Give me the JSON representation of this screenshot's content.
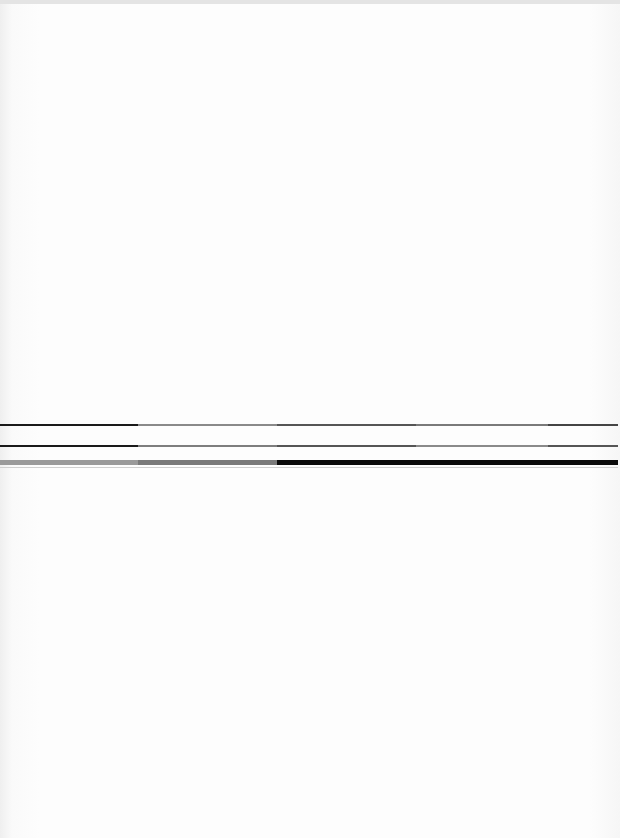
{
  "document": {
    "type": "faded scanned page",
    "visible_text": "",
    "rules": [
      {
        "name": "rule-1",
        "top": 424,
        "height": 2,
        "segments": [
          {
            "width": 138,
            "color": "#1a1a1a"
          },
          {
            "width": 139,
            "color": "#8a8a8a"
          },
          {
            "width": 139,
            "color": "#555555"
          },
          {
            "width": 132,
            "color": "#7a7a7a"
          },
          {
            "width": 70,
            "color": "#444444"
          }
        ]
      },
      {
        "name": "rule-2",
        "top": 445,
        "height": 2,
        "segments": [
          {
            "width": 138,
            "color": "#1a1a1a"
          },
          {
            "width": 139,
            "color": "#7e7e7e"
          },
          {
            "width": 139,
            "color": "#555555"
          },
          {
            "width": 132,
            "color": "#8a8a8a"
          },
          {
            "width": 70,
            "color": "#555555"
          }
        ]
      },
      {
        "name": "rule-3-thick",
        "top": 460,
        "height": 5,
        "segments": [
          {
            "width": 138,
            "color": "#9a9a9a"
          },
          {
            "width": 139,
            "color": "#7a7a7a"
          },
          {
            "width": 341,
            "color": "#0a0a0a"
          }
        ]
      },
      {
        "name": "rule-4-thin",
        "top": 467,
        "height": 1,
        "segments": [
          {
            "width": 618,
            "color": "#d0d0d0"
          }
        ]
      }
    ]
  }
}
